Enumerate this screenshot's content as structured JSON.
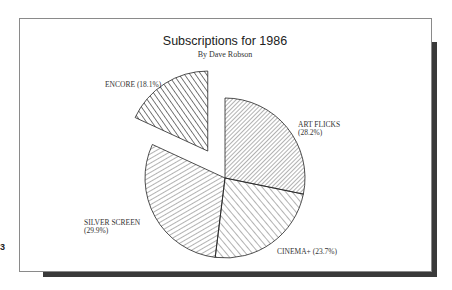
{
  "chart_data": {
    "type": "pie",
    "title": "Subscriptions for 1986",
    "subtitle": "By Dave Robson",
    "start_angle": "12 o'clock",
    "direction": "clockwise",
    "slices": [
      {
        "label": "ART FLICKS",
        "value": 28.2,
        "display": [
          "ART FLICKS",
          "(28.2%)"
        ],
        "pattern": "dense-diagonal-up",
        "exploded": false
      },
      {
        "label": "CINEMA+",
        "value": 23.7,
        "display": [
          "CINEMA+ (23.7%)"
        ],
        "pattern": "diagonal-down",
        "exploded": false
      },
      {
        "label": "SILVER SCREEN",
        "value": 29.9,
        "display": [
          "SILVER SCREEN",
          "(29.9%)"
        ],
        "pattern": "diagonal-up-shallow",
        "exploded": false
      },
      {
        "label": "ENCORE",
        "value": 18.1,
        "display": [
          "ENCORE (18.1%)"
        ],
        "pattern": "diagonal-down-wide",
        "exploded": true
      }
    ],
    "colors": {
      "stroke": "#222222",
      "frame_shadow": "#3a3a3a",
      "frame_border": "#8a8a8a"
    }
  },
  "page": {
    "edge_mark": "3"
  }
}
